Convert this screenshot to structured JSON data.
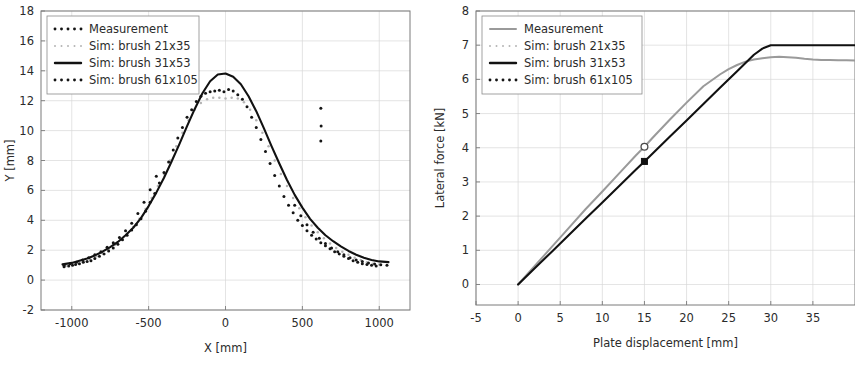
{
  "figure": {
    "background": "#ffffff",
    "text_color": "#2b2b2b",
    "grid_color": "#d8d8d8",
    "frame_color": "#7a7a7a"
  },
  "series_style": {
    "measurement_dark": "#151515",
    "sim_21x35": "#b4b4b4",
    "sim_31x53": "#111111",
    "sim_61x105": "#151515",
    "measurement_gray_line": "#9a9a9a"
  },
  "chart_data": [
    {
      "id": "left",
      "type": "scatter",
      "title": "",
      "xlabel": "X [mm]",
      "ylabel": "Y [mm]",
      "xlim": [
        -1200,
        1200
      ],
      "ylim": [
        -2,
        18
      ],
      "xticks": [
        -1000,
        -500,
        0,
        500,
        1000
      ],
      "xtick_labels": [
        "-1000",
        "-500",
        "0",
        "500",
        "1000"
      ],
      "yticks": [
        -2,
        0,
        2,
        4,
        6,
        8,
        10,
        12,
        14,
        16,
        18
      ],
      "ytick_labels": [
        "-2",
        "0",
        "2",
        "4",
        "6",
        "8",
        "10",
        "12",
        "14",
        "16",
        "18"
      ],
      "grid": true,
      "legend_position": "upper-left",
      "legend": [
        {
          "label": "Measurement",
          "style": "dots",
          "color": "#151515"
        },
        {
          "label": "Sim: brush 21x35",
          "style": "dots-light",
          "color": "#b4b4b4"
        },
        {
          "label": "Sim: brush 31x53",
          "style": "solid",
          "color": "#111111"
        },
        {
          "label": "Sim: brush 61x105",
          "style": "dots-thick",
          "color": "#151515"
        }
      ],
      "series": [
        {
          "name": "Sim: brush 31x53",
          "style": "solid",
          "color": "#111111",
          "x": [
            -1060,
            -1000,
            -950,
            -900,
            -850,
            -800,
            -750,
            -700,
            -650,
            -600,
            -550,
            -500,
            -450,
            -400,
            -350,
            -300,
            -250,
            -200,
            -150,
            -100,
            -50,
            0,
            50,
            100,
            150,
            200,
            250,
            300,
            350,
            400,
            450,
            500,
            550,
            600,
            650,
            700,
            750,
            800,
            850,
            900,
            950,
            1000,
            1060
          ],
          "y": [
            1.05,
            1.15,
            1.3,
            1.45,
            1.65,
            1.9,
            2.2,
            2.55,
            3.0,
            3.5,
            4.15,
            4.95,
            5.85,
            6.85,
            7.95,
            9.1,
            10.3,
            11.45,
            12.5,
            13.3,
            13.75,
            13.82,
            13.6,
            13.1,
            12.3,
            11.3,
            10.15,
            8.95,
            7.8,
            6.7,
            5.7,
            4.85,
            4.1,
            3.5,
            3.0,
            2.6,
            2.25,
            1.95,
            1.7,
            1.5,
            1.35,
            1.25,
            1.2
          ]
        },
        {
          "name": "Measurement",
          "style": "dots",
          "color": "#151515",
          "x": [
            -1050,
            -1020,
            -995,
            -975,
            -950,
            -925,
            -900,
            -875,
            -850,
            -820,
            -790,
            -760,
            -730,
            -700,
            -670,
            -640,
            -610,
            -580,
            -550,
            -520,
            -490,
            -460,
            -430,
            -400,
            -370,
            -340,
            -310,
            -280,
            -250,
            -220,
            -190,
            -160,
            -130,
            -100,
            -70,
            -40,
            -10,
            20,
            50,
            80,
            110,
            140,
            170,
            200,
            230,
            260,
            290,
            320,
            350,
            380,
            410,
            440,
            470,
            500,
            530,
            560,
            590,
            620,
            650,
            680,
            710,
            740,
            770,
            800,
            830,
            860,
            890,
            920,
            950,
            980
          ],
          "y": [
            0.9,
            0.95,
            1.0,
            1.05,
            1.1,
            1.2,
            1.25,
            1.3,
            1.45,
            1.6,
            1.75,
            1.95,
            2.15,
            2.4,
            2.7,
            3.0,
            3.35,
            3.7,
            4.1,
            4.6,
            5.2,
            5.8,
            6.5,
            7.2,
            7.9,
            8.7,
            9.5,
            10.2,
            10.9,
            11.4,
            11.95,
            12.3,
            12.5,
            12.6,
            12.65,
            12.7,
            12.6,
            12.75,
            12.65,
            12.4,
            12.1,
            11.6,
            10.9,
            10.2,
            9.4,
            8.6,
            7.8,
            7.0,
            6.3,
            5.6,
            5.0,
            4.5,
            4.0,
            3.65,
            3.3,
            3.0,
            2.75,
            2.5,
            2.3,
            2.1,
            1.9,
            1.75,
            1.6,
            1.45,
            1.3,
            1.2,
            1.1,
            1.05,
            1.0,
            0.95
          ]
        },
        {
          "name": "Sim: brush 21x35",
          "style": "dots-light",
          "color": "#b4b4b4",
          "x": [
            -1040,
            -1000,
            -960,
            -920,
            -880,
            -840,
            -800,
            -760,
            -720,
            -680,
            -640,
            -600,
            -560,
            -520,
            -480,
            -440,
            -400,
            -360,
            -320,
            -280,
            -240,
            -200,
            -160,
            -120,
            -80,
            -40,
            0,
            40,
            80,
            120,
            160,
            200,
            240,
            280,
            320,
            360,
            400,
            440,
            480,
            520,
            560,
            600,
            640,
            680,
            720,
            760,
            800,
            840,
            880,
            920,
            960,
            1000
          ],
          "y": [
            0.95,
            1.05,
            1.15,
            1.25,
            1.4,
            1.6,
            1.8,
            2.05,
            2.35,
            2.7,
            3.1,
            3.55,
            4.1,
            4.75,
            5.5,
            6.3,
            7.1,
            8.0,
            8.95,
            9.85,
            10.7,
            11.4,
            11.85,
            12.1,
            12.2,
            12.2,
            12.15,
            12.2,
            12.15,
            11.9,
            11.4,
            10.7,
            9.85,
            8.95,
            8.0,
            7.1,
            6.3,
            5.5,
            4.8,
            4.2,
            3.65,
            3.2,
            2.8,
            2.45,
            2.15,
            1.9,
            1.7,
            1.5,
            1.35,
            1.2,
            1.1,
            1.05
          ]
        },
        {
          "name": "Sim: brush 61x105",
          "style": "dots-thick",
          "color": "#151515",
          "x": [
            -1050,
            -1010,
            -970,
            -930,
            -890,
            -850,
            -810,
            -770,
            -730,
            -690,
            -650,
            -610,
            -570,
            -530,
            -490,
            -450,
            450,
            490,
            530,
            570,
            610,
            650,
            690,
            730,
            770,
            810,
            850,
            890,
            930,
            970,
            1010,
            1050
          ],
          "y": [
            1.0,
            1.1,
            1.2,
            1.35,
            1.5,
            1.7,
            1.9,
            2.2,
            2.5,
            2.85,
            3.3,
            3.8,
            4.45,
            5.2,
            6.05,
            6.95,
            5.0,
            4.3,
            3.7,
            3.2,
            2.8,
            2.45,
            2.15,
            1.9,
            1.7,
            1.5,
            1.35,
            1.25,
            1.15,
            1.08,
            1.02,
            1.0
          ]
        },
        {
          "name": "outliers",
          "style": "dots-outlier",
          "color": "#151515",
          "x": [
            620,
            622,
            620
          ],
          "y": [
            11.5,
            10.3,
            9.3
          ]
        }
      ]
    },
    {
      "id": "right",
      "type": "line",
      "title": "",
      "xlabel": "Plate displacement [mm]",
      "ylabel": "Lateral force [kN]",
      "xlim": [
        -5,
        40
      ],
      "ylim": [
        -0.6,
        8
      ],
      "xticks": [
        -5,
        0,
        5,
        10,
        15,
        20,
        25,
        30,
        35
      ],
      "xtick_labels": [
        "-5",
        "0",
        "5",
        "10",
        "15",
        "20",
        "25",
        "30",
        "35"
      ],
      "yticks": [
        0,
        1,
        2,
        3,
        4,
        5,
        6,
        7,
        8
      ],
      "ytick_labels": [
        "0",
        "1",
        "2",
        "3",
        "4",
        "5",
        "6",
        "7",
        "8"
      ],
      "grid": true,
      "legend_position": "upper-left",
      "legend": [
        {
          "label": "Measurement",
          "style": "solid-gray",
          "color": "#9a9a9a"
        },
        {
          "label": "Sim: brush 21x35",
          "style": "dots-light",
          "color": "#b4b4b4"
        },
        {
          "label": "Sim: brush 31x53",
          "style": "solid",
          "color": "#111111"
        },
        {
          "label": "Sim: brush 61x105",
          "style": "dots-thick",
          "color": "#151515"
        }
      ],
      "series": [
        {
          "name": "Measurement",
          "style": "solid-gray",
          "color": "#9a9a9a",
          "x": [
            0,
            2,
            4,
            6,
            8,
            10,
            12,
            14,
            15,
            16,
            18,
            20,
            22,
            24,
            25,
            26,
            27,
            28,
            29,
            30,
            31,
            32,
            33,
            34,
            35,
            36,
            37,
            38,
            39,
            40
          ],
          "y": [
            0.0,
            0.55,
            1.1,
            1.65,
            2.2,
            2.72,
            3.25,
            3.78,
            4.03,
            4.3,
            4.82,
            5.32,
            5.8,
            6.15,
            6.3,
            6.42,
            6.52,
            6.58,
            6.62,
            6.65,
            6.66,
            6.65,
            6.63,
            6.6,
            6.58,
            6.57,
            6.57,
            6.56,
            6.56,
            6.55
          ]
        },
        {
          "name": "Sim: brush 31x53",
          "style": "solid",
          "color": "#111111",
          "x": [
            0,
            2,
            4,
            6,
            8,
            10,
            12,
            14,
            15,
            16,
            18,
            20,
            22,
            24,
            26,
            28,
            29,
            30,
            31,
            33,
            35,
            37,
            40
          ],
          "y": [
            0.0,
            0.48,
            0.96,
            1.44,
            1.92,
            2.4,
            2.88,
            3.36,
            3.6,
            3.84,
            4.32,
            4.8,
            5.28,
            5.76,
            6.24,
            6.72,
            6.9,
            7.0,
            7.0,
            7.0,
            7.0,
            7.0,
            7.0
          ]
        }
      ],
      "markers": [
        {
          "name": "measurement-marker",
          "x": 15,
          "y": 4.03,
          "shape": "circle-open",
          "color": "#4a4a4a"
        },
        {
          "name": "sim-marker",
          "x": 15,
          "y": 3.6,
          "shape": "square-filled",
          "color": "#111111"
        }
      ]
    }
  ]
}
